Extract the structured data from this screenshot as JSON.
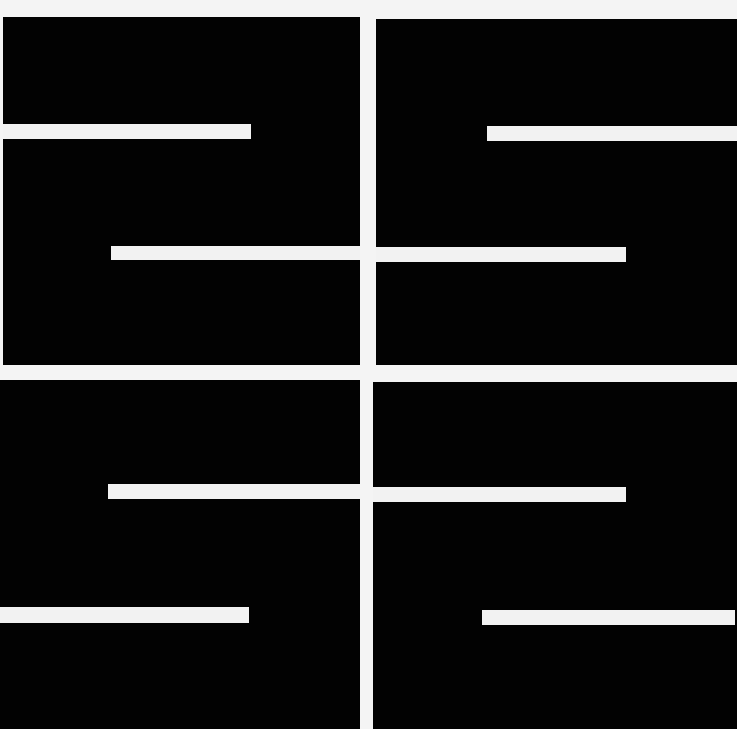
{
  "artwork": {
    "description": "Abstract black painting of four panels divided by white gaps, with horizontal white bars",
    "colors": {
      "background": "#f4f4f4",
      "panel": "#020202",
      "bar": "#f2f2f2"
    },
    "panels": [
      {
        "id": "top-left",
        "x": 3,
        "y": 17,
        "w": 357,
        "h": 348
      },
      {
        "id": "top-right",
        "x": 376,
        "y": 19,
        "w": 361,
        "h": 346
      },
      {
        "id": "bottom-left",
        "x": 0,
        "y": 380,
        "w": 360,
        "h": 349
      },
      {
        "id": "bottom-right",
        "x": 373,
        "y": 382,
        "w": 364,
        "h": 347
      }
    ],
    "bars": [
      {
        "x": 3,
        "y": 124,
        "w": 248,
        "h": 15
      },
      {
        "x": 487,
        "y": 126,
        "w": 250,
        "h": 15
      },
      {
        "x": 111,
        "y": 246,
        "w": 249,
        "h": 14
      },
      {
        "x": 376,
        "y": 247,
        "w": 250,
        "h": 15
      },
      {
        "x": 108,
        "y": 484,
        "w": 252,
        "h": 15
      },
      {
        "x": 373,
        "y": 487,
        "w": 253,
        "h": 15
      },
      {
        "x": 0,
        "y": 607,
        "w": 249,
        "h": 16
      },
      {
        "x": 482,
        "y": 610,
        "w": 253,
        "h": 15
      }
    ]
  }
}
